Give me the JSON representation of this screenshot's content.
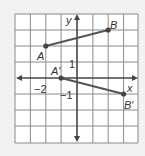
{
  "diagram": {
    "grid": {
      "x_min": -4,
      "x_max": 4,
      "y_min": -4,
      "y_max": 4
    },
    "axes": {
      "x_label": "x",
      "y_label": "y"
    },
    "tick_labels": {
      "x_neg2": "−2",
      "y_pos1": "1",
      "y_neg1": "−1"
    },
    "points": [
      {
        "name": "A",
        "label": "A",
        "x": -2,
        "y": 2
      },
      {
        "name": "B",
        "label": "B",
        "x": 2,
        "y": 3
      },
      {
        "name": "A_prime",
        "label": "A′",
        "x": -1,
        "y": 0
      },
      {
        "name": "B_prime",
        "label": "B′",
        "x": 3,
        "y": -1
      }
    ],
    "segments": [
      {
        "from": "A",
        "to": "B"
      },
      {
        "from": "A_prime",
        "to": "B_prime"
      }
    ],
    "colors": {
      "background": "#f2f2f2",
      "grid_fill": "#ffffff",
      "grid_line": "#888888",
      "axis": "#444444",
      "segment": "#555555"
    }
  }
}
